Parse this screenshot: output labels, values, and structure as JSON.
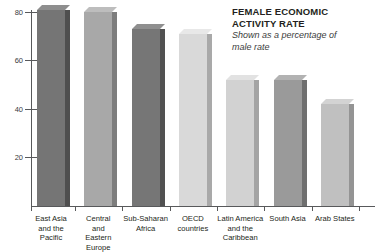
{
  "chart_data": {
    "type": "bar",
    "title": "FEMALE ECONOMIC\nACTIVITY RATE",
    "subtitle": "Shown as a percentage of\nmale rate",
    "xlabel": "",
    "ylabel": "",
    "ylim": [
      0,
      86
    ],
    "grid": false,
    "legend": false,
    "yticks": [
      20,
      40,
      60,
      80
    ],
    "ytick_labels": [
      "20",
      "40",
      "60",
      "80"
    ],
    "categories": [
      "East Asia\nand the\nPacific",
      "Central\nand\nEastern Europe",
      "Sub-Saharan\nAfrica",
      "OECD\ncountries",
      "Latin America\nand the\nCaribbean",
      "South Asia",
      "Arab States"
    ],
    "values": [
      81,
      80,
      73,
      71,
      52,
      52,
      42
    ],
    "bar_colors": [
      "#757575",
      "#a8a8a8",
      "#767676",
      "#d9d9d9",
      "#d2d2d2",
      "#9a9a9a",
      "#c0c0c0"
    ],
    "bar_side_colors": [
      "#4f4f4f",
      "#7d7d7d",
      "#515151",
      "#a9a9a9",
      "#a4a4a4",
      "#6f6f6f",
      "#949494"
    ],
    "bar_top_colors": [
      "#8e8e8e",
      "#bdbdbd",
      "#8f8f8f",
      "#e8e8e8",
      "#e2e2e2",
      "#b2b2b2",
      "#d3d3d3"
    ],
    "axis_color": "#58595b",
    "text_color": "#231f20"
  }
}
